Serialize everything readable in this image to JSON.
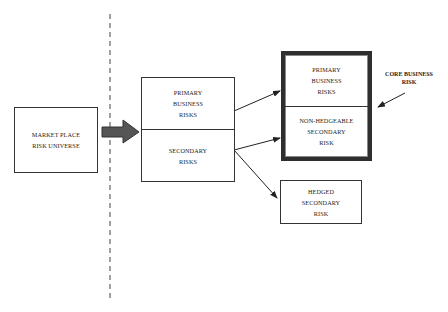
{
  "diagram": {
    "market_box": {
      "text": "MARKET PLACE\nRISK UNIVERSE"
    },
    "middle_box": {
      "top": "PRIMARY\nBUSINESS\nRISKS",
      "bottom": "SECONDARY\nRISKS"
    },
    "core_box": {
      "top": "PRIMARY\nBUSINESS\nRISKS",
      "bottom": "NON-HEDGEABLE\nSECONDARY\nRISK"
    },
    "hedged_box": {
      "text": "HEDGED\nSECONDARY\nRISK"
    },
    "core_label": "CORE BUSINESS\nRISK",
    "colors": {
      "line": "#333333",
      "block_arrow": "#555555",
      "background": "#ffffff"
    }
  }
}
